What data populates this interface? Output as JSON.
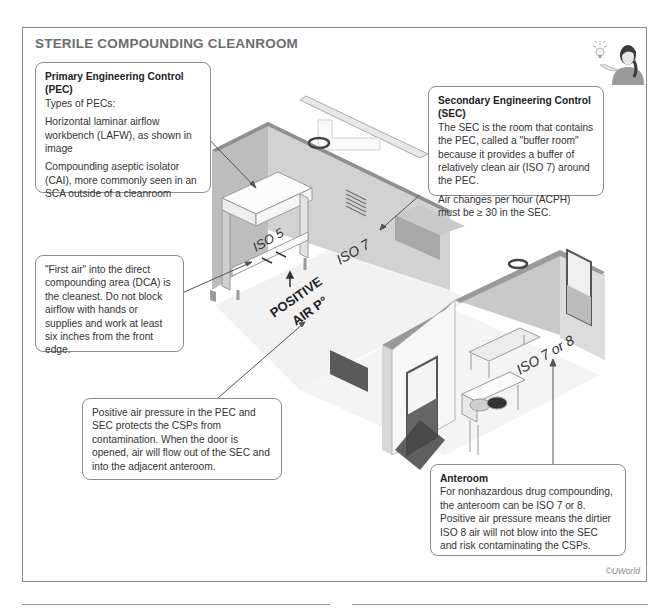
{
  "title": "STERILE COMPOUNDING CLEANROOM",
  "copyright": "©UWorld",
  "callouts": {
    "pec": {
      "heading": "Primary Engineering Control (PEC)",
      "subheading": "Types of PECs:",
      "para1": "Horizontal laminar airflow workbench (LAFW), as shown in image",
      "para2": "Compounding aseptic isolator (CAI), more commonly seen in an SCA outside of a cleanroom"
    },
    "sec": {
      "heading": "Secondary Engineering Control (SEC)",
      "para1": "The SEC is the room that contains the PEC, called a \"buffer room\" because it provides a buffer of relatively clean air (ISO 7) around the PEC.",
      "para2": "Air changes per hour (ACPH) must be ≥ 30 in the SEC."
    },
    "first_air": {
      "text": "\"First air\" into the direct compounding area (DCA) is the cleanest. Do not block airflow with hands or supplies and work at least six inches from the front edge."
    },
    "positive_pressure": {
      "text": "Positive air pressure in the PEC and SEC protects the CSPs from contamination. When the door is opened, air will flow out of the SEC and into the adjacent anteroom."
    },
    "anteroom": {
      "heading": "Anteroom",
      "text": "For nonhazardous drug compounding, the anteroom can be ISO 7 or 8. Positive air pressure means the dirtier ISO 8 air will not blow into the SEC and risk contaminating the CSPs."
    }
  },
  "labels": {
    "iso5": "ISO 5",
    "iso7": "ISO 7",
    "iso7or8": "ISO 7 or 8",
    "positive": "POSITIVE",
    "air_p": "AIR P°"
  },
  "icons": {
    "avatar": "presenter-with-lightbulb-icon",
    "arrow_up": "airflow-arrow-icon"
  },
  "colors": {
    "wall_dark": "#9d9d9d",
    "wall_mid": "#c4c4c4",
    "wall_light": "#e2e2e2",
    "floor": "#f1f1f1",
    "frame_border": "#8a8a8a",
    "title": "#6e6e6e",
    "door_dark": "#555555"
  }
}
